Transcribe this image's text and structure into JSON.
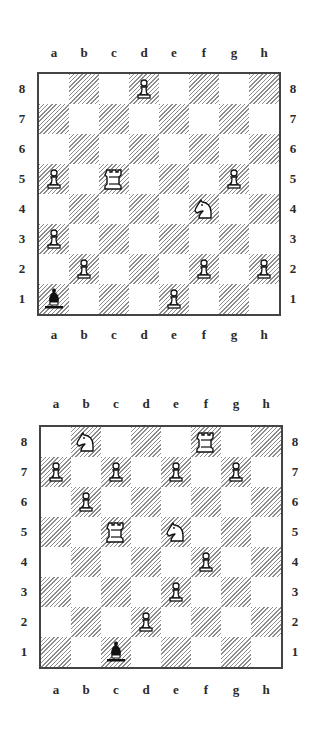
{
  "files": [
    "a",
    "b",
    "c",
    "d",
    "e",
    "f",
    "g",
    "h"
  ],
  "ranks": [
    "8",
    "7",
    "6",
    "5",
    "4",
    "3",
    "2",
    "1"
  ],
  "colors": {
    "dark_hatch": "#8c8c8c",
    "light": "#ffffff",
    "border": "#444444"
  },
  "diagrams": [
    {
      "id": "diagram-1",
      "pieces": [
        {
          "square": "d8",
          "color": "white",
          "type": "pawn"
        },
        {
          "square": "a5",
          "color": "white",
          "type": "pawn"
        },
        {
          "square": "c5",
          "color": "white",
          "type": "rook"
        },
        {
          "square": "g5",
          "color": "white",
          "type": "pawn"
        },
        {
          "square": "f4",
          "color": "white",
          "type": "knight"
        },
        {
          "square": "a3",
          "color": "white",
          "type": "pawn"
        },
        {
          "square": "b2",
          "color": "white",
          "type": "pawn"
        },
        {
          "square": "f2",
          "color": "white",
          "type": "pawn"
        },
        {
          "square": "h2",
          "color": "white",
          "type": "pawn"
        },
        {
          "square": "a1",
          "color": "black",
          "type": "bishop"
        },
        {
          "square": "e1",
          "color": "white",
          "type": "pawn"
        }
      ]
    },
    {
      "id": "diagram-2",
      "pieces": [
        {
          "square": "b8",
          "color": "white",
          "type": "knight"
        },
        {
          "square": "f8",
          "color": "white",
          "type": "rook"
        },
        {
          "square": "a7",
          "color": "white",
          "type": "pawn"
        },
        {
          "square": "c7",
          "color": "white",
          "type": "pawn"
        },
        {
          "square": "e7",
          "color": "white",
          "type": "pawn"
        },
        {
          "square": "g7",
          "color": "white",
          "type": "pawn"
        },
        {
          "square": "b6",
          "color": "white",
          "type": "pawn"
        },
        {
          "square": "c5",
          "color": "white",
          "type": "rook"
        },
        {
          "square": "e5",
          "color": "white",
          "type": "knight"
        },
        {
          "square": "f4",
          "color": "white",
          "type": "pawn"
        },
        {
          "square": "e3",
          "color": "white",
          "type": "pawn"
        },
        {
          "square": "d2",
          "color": "white",
          "type": "pawn"
        },
        {
          "square": "c1",
          "color": "black",
          "type": "bishop"
        }
      ]
    }
  ]
}
